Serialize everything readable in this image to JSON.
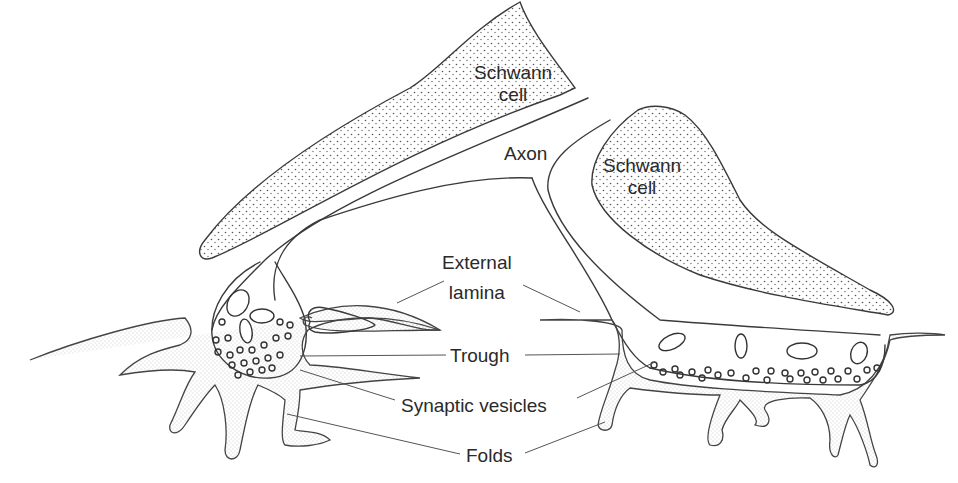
{
  "diagram": {
    "labels": {
      "schwann_cell_top": [
        "Schwann",
        "cell"
      ],
      "axon": "Axon",
      "schwann_cell_right": [
        "Schwann",
        "cell"
      ],
      "external_lamina": [
        "External",
        "lamina"
      ],
      "trough": "Trough",
      "synaptic_vesicles": "Synaptic vesicles",
      "folds": "Folds"
    },
    "colors": {
      "line": "#3a3a3a",
      "stipple": "#555555",
      "background": "#ffffff"
    }
  }
}
